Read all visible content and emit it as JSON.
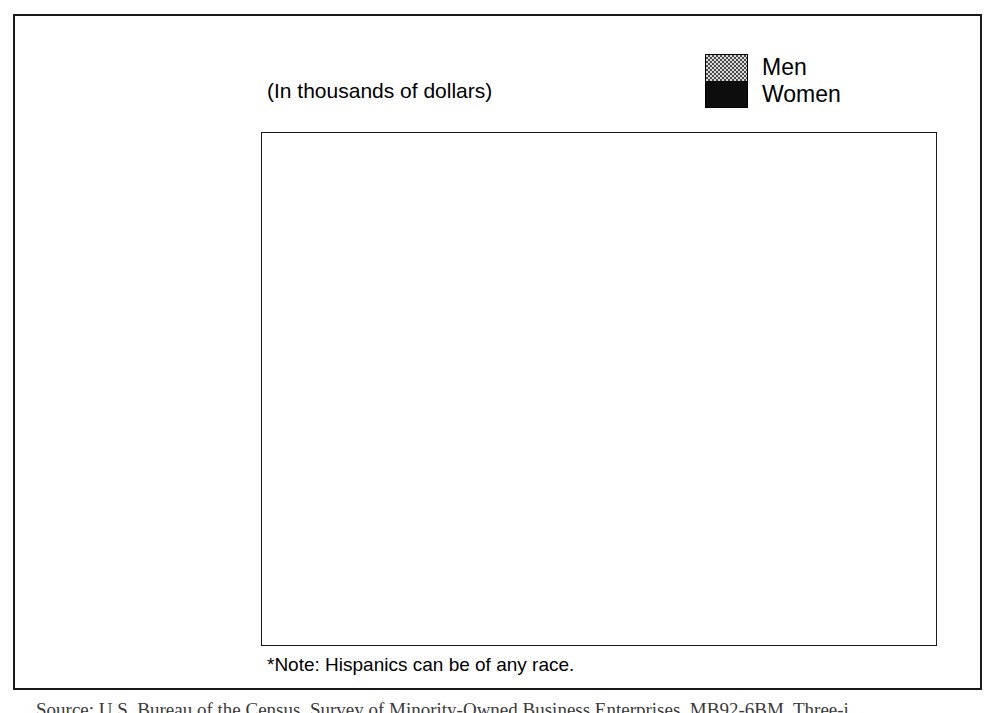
{
  "figure": {
    "subtitle": "(In thousands of dollars)",
    "footnote": "*Note:  Hispanics can be of any race.",
    "source_caption": "Source:  U.S. Bureau of the Census, Survey of Minority-Owned Business Enterprises, MB92-6BM, Three-i"
  },
  "legend": {
    "men_label": "Men",
    "women_label": "Women",
    "men_pattern": "dotted-light",
    "women_pattern": "solid-black",
    "men_color": "#d8d8d8",
    "women_color": "#0d0d0d"
  },
  "chart_data": {
    "type": "bar",
    "orientation": "horizontal",
    "title": "",
    "subtitle": "(In thousands of dollars)",
    "xlabel": "",
    "ylabel": "",
    "xlim": [
      0,
      207
    ],
    "grid": false,
    "legend_position": "top-right",
    "categories": [
      "White",
      "Black",
      "Asian American\nand Pacific Islander",
      "American Indian\nand Alaska Native",
      "Hispanic*"
    ],
    "category_lines": [
      [
        "White"
      ],
      [
        "Black"
      ],
      [
        "Asian American",
        "and Pacific Islander"
      ],
      [
        "American Indian",
        "and Alaska Native"
      ],
      [
        "Hispanic*"
      ]
    ],
    "series": [
      {
        "name": "Men",
        "values": [
          189,
          50,
          107,
          47,
          66
        ]
      },
      {
        "name": "Women",
        "values": [
          70,
          41,
          64,
          32,
          38
        ]
      }
    ],
    "value_labels": {
      "Men": [
        "189",
        "50",
        "107",
        "47",
        "66"
      ],
      "Women": [
        "70",
        "41",
        "64",
        "32",
        "38"
      ]
    },
    "note": "*Note:  Hispanics can be of any race."
  },
  "layout": {
    "px_per_unit": 3.225,
    "bar_height_px": 44,
    "group_gap_px": 18,
    "group_tops_px": [
      22,
      122,
      222,
      322,
      422
    ]
  }
}
